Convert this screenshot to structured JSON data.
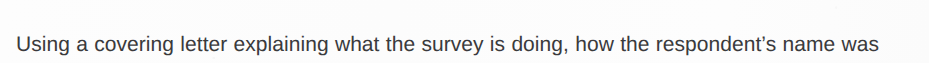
{
  "document": {
    "background_color": "#fdfdfd",
    "text_color": "#3a3a3c",
    "paragraph": {
      "line_1": "Using a covering letter explaining what the survey is doing, how the respondent’s name was",
      "line_2": "selected, and why he or she should reply."
    }
  }
}
